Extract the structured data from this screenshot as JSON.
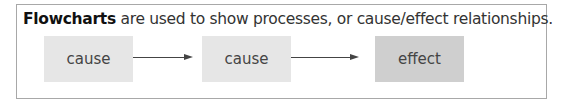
{
  "caption": {
    "bold": "Flowcharts",
    "rest": " are used to show processes, or cause/effect relationships."
  },
  "nodes": [
    {
      "label": "cause",
      "color": "#e6e6e6"
    },
    {
      "label": "cause",
      "color": "#e6e6e6"
    },
    {
      "label": "effect",
      "color": "#cccccc"
    }
  ],
  "arrows": [
    {
      "from": 0,
      "to": 1
    },
    {
      "from": 1,
      "to": 2
    }
  ]
}
